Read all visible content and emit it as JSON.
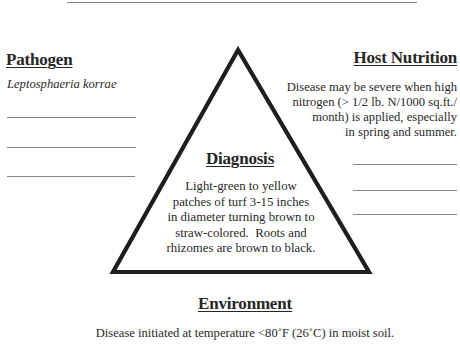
{
  "pathogen": {
    "heading": "Pathogen",
    "organism": "Leptosphaeria korrae",
    "blank_lines": 3
  },
  "host_nutrition": {
    "heading": "Host Nutrition",
    "lines": [
      "Disease may be severe when high",
      "nitrogen (> 1/2 lb. N/1000 sq.ft./",
      "month) is applied, especially",
      "in spring and summer."
    ],
    "blank_lines": 3
  },
  "diagnosis": {
    "heading": "Diagnosis",
    "lines": [
      "Light-green to yellow",
      "patches of turf 3-15 inches",
      "in diameter turning brown to",
      "straw-colored.  Roots and",
      "rhizomes are brown to black."
    ]
  },
  "environment": {
    "heading": "Environment",
    "text": "Disease initiated at temperature <80˚F (26˚C) in moist soil."
  },
  "colors": {
    "ink": "#222222",
    "rule": "#888888",
    "triangle_stroke": "#1e1e1e"
  }
}
